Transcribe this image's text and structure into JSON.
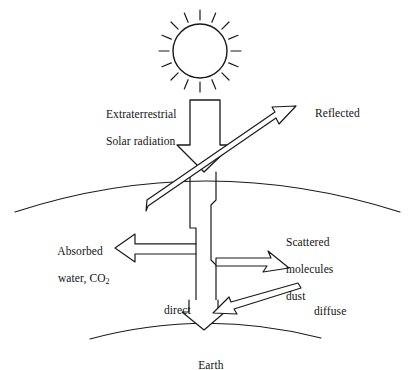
{
  "figure": {
    "title_role": "solar-radiation-atmosphere-diagram",
    "stroke_color": "#1a1a1a",
    "fill_color": "#ffffff",
    "background": "#ffffff"
  },
  "labels": {
    "extraterrestrial_line1": "Extraterrestrial",
    "extraterrestrial_line2": "Solar radiation",
    "reflected": "Reflected",
    "absorbed_line1": "Absorbed",
    "absorbed_line2_prefix": "water, CO",
    "absorbed_line2_sub": "2",
    "scattered_line1": "Scattered",
    "scattered_line2": "molecules",
    "scattered_line3": "dust",
    "direct": "direct",
    "diffuse": "diffuse",
    "earth": "Earth"
  },
  "elements": {
    "sun": "sun-icon",
    "sun_rays": 16,
    "atmosphere_arc": "atmosphere-boundary-arc",
    "earth_arc": "earth-surface-arc",
    "incoming_arrow": "incoming-solar-radiation-arrow",
    "reflected_arrow": "reflected-radiation-arrow",
    "absorbed_arrow": "absorbed-radiation-arrow",
    "scattered_arrow": "scattered-radiation-arrow",
    "diffuse_arrow": "diffuse-radiation-arrow",
    "direct_arrow": "direct-radiation-arrow",
    "beam_channel": "radiation-beam-channel"
  }
}
